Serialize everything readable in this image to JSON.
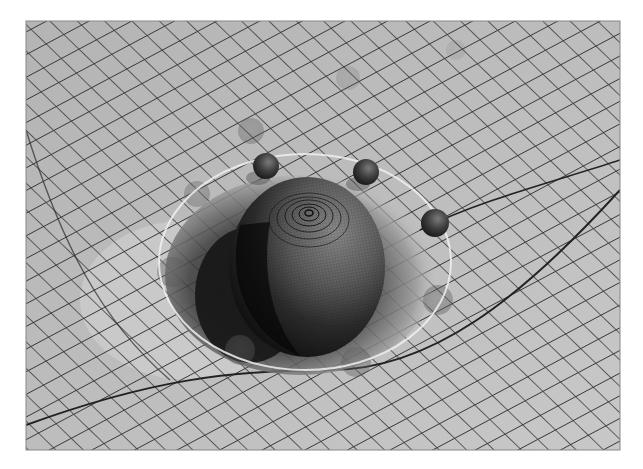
{
  "image": {
    "subject": "spacetime curvature illustration",
    "width": 643,
    "height": 469,
    "frame": {
      "x": 26,
      "y": 21,
      "w": 594,
      "h": 429
    },
    "colors": {
      "background": "#ffffff",
      "grid_surface": "#b9b9b9",
      "grid_surface_light": "#cfcfcf",
      "grid_line": "#3a3a3a",
      "well_shadow": "#1e1e1e",
      "sphere_dark": "#151515",
      "sphere_mid": "#5a5a5a",
      "ring": "#efefef"
    }
  },
  "objects": {
    "central_mass": {
      "cx": 307,
      "cy": 267,
      "rx": 78,
      "ry": 90
    },
    "orbit_ring": {
      "cx": 305,
      "cy": 262,
      "rx": 146,
      "ry": 108
    },
    "orbiting_spheres": [
      {
        "cx": 266,
        "cy": 166,
        "r": 13
      },
      {
        "cx": 366,
        "cy": 172,
        "r": 13
      },
      {
        "cx": 435,
        "cy": 223,
        "r": 14
      }
    ],
    "ghost_spheres": [
      {
        "cx": 251,
        "cy": 131,
        "r": 13,
        "o": 0.35
      },
      {
        "cx": 197,
        "cy": 194,
        "r": 13,
        "o": 0.35
      },
      {
        "cx": 172,
        "cy": 272,
        "r": 15,
        "o": 0.4
      },
      {
        "cx": 438,
        "cy": 300,
        "r": 15,
        "o": 0.4
      },
      {
        "cx": 240,
        "cy": 350,
        "r": 15,
        "o": 0.4
      },
      {
        "cx": 356,
        "cy": 362,
        "r": 15,
        "o": 0.4
      },
      {
        "cx": 348,
        "cy": 78,
        "r": 12,
        "o": 0.18
      },
      {
        "cx": 456,
        "cy": 50,
        "r": 10,
        "o": 0.12
      }
    ]
  }
}
